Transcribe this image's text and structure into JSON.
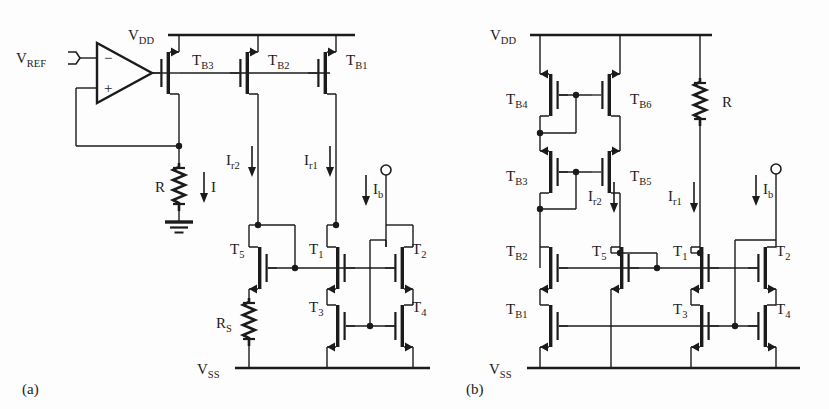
{
  "figure": {
    "background": "#fdfdfd",
    "ink": "#1b1b1b",
    "width": 829,
    "height": 409
  },
  "captions": {
    "a": "(a)",
    "b": "(b)"
  },
  "circuit_a": {
    "rails": {
      "vdd": "V",
      "vdd_sub": "DD",
      "vss": "V",
      "vss_sub": "SS"
    },
    "opamp": {
      "minus": "−",
      "plus": "+",
      "input_label": "V",
      "input_sub": "REF"
    },
    "resistors": [
      {
        "label": "R",
        "sub": ""
      },
      {
        "label": "R",
        "sub": "S"
      }
    ],
    "currents": [
      {
        "label": "I",
        "sub": ""
      },
      {
        "label": "I",
        "sub": "r2"
      },
      {
        "label": "I",
        "sub": "r1"
      },
      {
        "label": "I",
        "sub": "b"
      }
    ],
    "transistors": [
      {
        "label": "T",
        "sub": "B3",
        "type": "pmos"
      },
      {
        "label": "T",
        "sub": "B2",
        "type": "pmos"
      },
      {
        "label": "T",
        "sub": "B1",
        "type": "pmos"
      },
      {
        "label": "T",
        "sub": "5",
        "type": "nmos"
      },
      {
        "label": "T",
        "sub": "1",
        "type": "nmos"
      },
      {
        "label": "T",
        "sub": "2",
        "type": "nmos"
      },
      {
        "label": "T",
        "sub": "3",
        "type": "nmos"
      },
      {
        "label": "T",
        "sub": "4",
        "type": "nmos"
      }
    ]
  },
  "circuit_b": {
    "rails": {
      "vdd": "V",
      "vdd_sub": "DD",
      "vss": "V",
      "vss_sub": "SS"
    },
    "resistors": [
      {
        "label": "R",
        "sub": ""
      }
    ],
    "currents": [
      {
        "label": "I",
        "sub": "r2"
      },
      {
        "label": "I",
        "sub": "r1"
      },
      {
        "label": "I",
        "sub": "b"
      }
    ],
    "transistors": [
      {
        "label": "T",
        "sub": "B4",
        "type": "pmos"
      },
      {
        "label": "T",
        "sub": "B6",
        "type": "pmos"
      },
      {
        "label": "T",
        "sub": "B3",
        "type": "pmos"
      },
      {
        "label": "T",
        "sub": "B5",
        "type": "pmos"
      },
      {
        "label": "T",
        "sub": "B2",
        "type": "nmos"
      },
      {
        "label": "T",
        "sub": "B1",
        "type": "nmos"
      },
      {
        "label": "T",
        "sub": "5",
        "type": "nmos"
      },
      {
        "label": "T",
        "sub": "1",
        "type": "nmos"
      },
      {
        "label": "T",
        "sub": "2",
        "type": "nmos"
      },
      {
        "label": "T",
        "sub": "3",
        "type": "nmos"
      },
      {
        "label": "T",
        "sub": "4",
        "type": "nmos"
      }
    ]
  }
}
